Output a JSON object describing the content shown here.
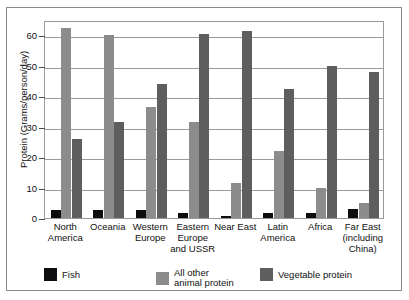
{
  "chart_data": {
    "type": "bar",
    "title": "",
    "xlabel": "",
    "ylabel": "Protein (Grams/person/day)",
    "ylim": [
      0,
      65
    ],
    "yticks": [
      0,
      10,
      20,
      30,
      40,
      50,
      60
    ],
    "ytick_labels": [
      "0",
      "10",
      "20",
      "30",
      "40",
      "50",
      "60"
    ],
    "grid": true,
    "legend_position": "bottom",
    "categories": [
      "North\nAmerica",
      "Oceania",
      "Western\nEurope",
      "Eastern\nEurope\nand USSR",
      "Near East",
      "Latin\nAmerica",
      "Africa",
      "Far East\n(including\nChina)"
    ],
    "series": [
      {
        "name": "Fish",
        "color": "#0d0d0d",
        "values": [
          2.5,
          2.5,
          2.5,
          1.5,
          0.8,
          1.5,
          1.5,
          3.0
        ]
      },
      {
        "name": "All other\nanimal protein",
        "color": "#8c8c8c",
        "values": [
          62.5,
          60.0,
          36.5,
          31.5,
          11.5,
          22.0,
          10.0,
          5.0
        ]
      },
      {
        "name": "Vegetable protein",
        "color": "#5e5e5e",
        "values": [
          26.0,
          31.5,
          44.0,
          60.5,
          61.5,
          42.5,
          50.0,
          48.0
        ]
      }
    ]
  },
  "colors": {
    "fish": "#0d0d0d",
    "animal_protein": "#8c8c8c",
    "vegetable_protein": "#5e5e5e",
    "axis": "#4a4a4a",
    "grid": "#9a9a9a",
    "frame": "#8a8a8a",
    "background": "#ffffff"
  }
}
